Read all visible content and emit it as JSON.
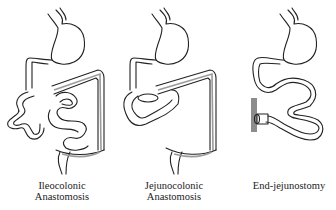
{
  "figure": {
    "panels": [
      {
        "id": "ileocolonic",
        "caption_lines": [
          "Ileocolonic",
          "Anastomosis"
        ]
      },
      {
        "id": "jejunocolonic",
        "caption_lines": [
          "Jejunocolonic",
          "Anastomosis"
        ]
      },
      {
        "id": "end-jejunostomy",
        "caption_lines": [
          "End-jejunostomy"
        ]
      }
    ],
    "colors": {
      "outline": "#222222",
      "colon_stripe": "#9a9a9a",
      "abdominal_wall": "#8c8c8c",
      "background": "#ffffff"
    }
  }
}
